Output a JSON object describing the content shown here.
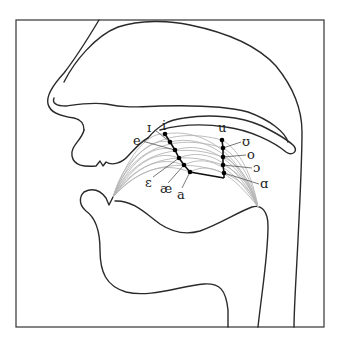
{
  "diagram": {
    "colors": {
      "outline": "#2a2a2a",
      "tongue_contours": "#b5b5b5",
      "vowel_points": "#000000",
      "background": "#ffffff"
    },
    "front_vowels": [
      {
        "symbol": "i",
        "label_x": 164,
        "label_y": 128,
        "point": [
          165,
          134
        ]
      },
      {
        "symbol": "ɪ",
        "label_x": 149,
        "label_y": 131,
        "point": [
          170,
          142
        ]
      },
      {
        "symbol": "e",
        "label_x": 136,
        "label_y": 144,
        "point": [
          175,
          150
        ]
      },
      {
        "symbol": "ɛ",
        "label_x": 148,
        "label_y": 184,
        "point": [
          179,
          158
        ]
      },
      {
        "symbol": "æ",
        "label_x": 164,
        "label_y": 191,
        "point": [
          184,
          165
        ]
      },
      {
        "symbol": "a",
        "label_x": 178,
        "label_y": 197,
        "point": [
          190,
          172
        ]
      }
    ],
    "back_vowels": [
      {
        "symbol": "u",
        "label_x": 219,
        "label_y": 131,
        "point": [
          222,
          140
        ]
      },
      {
        "symbol": "ʊ",
        "label_x": 243,
        "label_y": 146,
        "point": [
          223,
          148
        ]
      },
      {
        "symbol": "o",
        "label_x": 249,
        "label_y": 159,
        "point": [
          223,
          157
        ]
      },
      {
        "symbol": "ɔ",
        "label_x": 255,
        "label_y": 172,
        "point": [
          223,
          165
        ]
      },
      {
        "symbol": "ɑ",
        "label_x": 262,
        "label_y": 188,
        "point": [
          224,
          173
        ]
      }
    ],
    "fan_origin_front": [
      113,
      197
    ],
    "fan_origin_back": [
      258,
      207
    ]
  }
}
